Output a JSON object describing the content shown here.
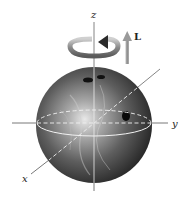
{
  "diagram": {
    "axes": {
      "z_label": "z",
      "y_label": "y",
      "x_label": "x"
    },
    "angular_momentum_label": "L",
    "colors": {
      "ball_dark": "#2a2a2a",
      "ball_mid": "#6e6e6e",
      "ball_highlight": "#e8e8e8",
      "axis": "#555555",
      "arrow": "#9a9a9a",
      "equator": "#f2f2f2"
    }
  }
}
